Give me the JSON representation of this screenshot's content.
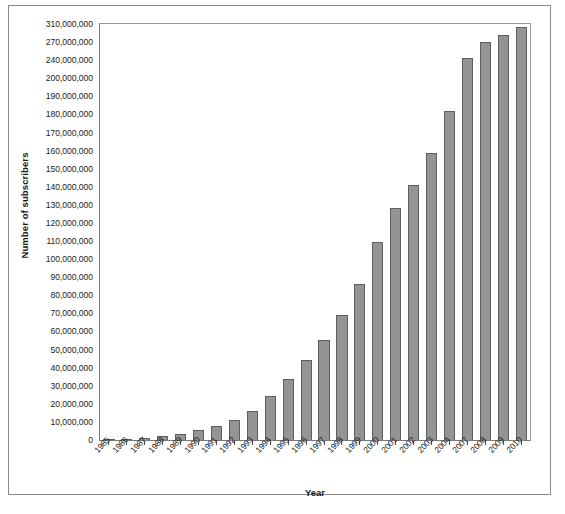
{
  "chart_data": {
    "type": "bar",
    "title": "",
    "xlabel": "Year",
    "ylabel": "Number of subscribers",
    "ylim": [
      0,
      310000000
    ],
    "grid": false,
    "legend": null,
    "bar_color": "#949494",
    "bar_edge_color": "#5f5f5f",
    "categories": [
      "1985",
      "1986",
      "1987",
      "1988",
      "1989",
      "1990",
      "1991",
      "1992",
      "1993",
      "1994",
      "1995",
      "1996",
      "1997",
      "1998",
      "1999",
      "2000",
      "2001",
      "2002",
      "2003",
      "2004",
      "2007",
      "2008",
      "2009",
      "2010"
    ],
    "values": [
      340213,
      681825,
      1230855,
      2069441,
      3508944,
      5283055,
      7557148,
      11032753,
      16009461,
      24134421,
      33785661,
      44042992,
      55312293,
      69209321,
      86047003,
      109478031,
      128374512,
      140766842,
      158721981,
      182140362,
      243428000,
      270333881,
      285646191,
      302859674
    ],
    "value_labels": [
      "340,213",
      "681,825",
      "1,230,855",
      "2,069,441",
      "3,508,944",
      "5,283,055",
      "7,557,148",
      "11,032,753",
      "16,009,461",
      "24,134,421",
      "33,785,661",
      "44,042,992",
      "55,312,293",
      "69,209,321",
      "86,047,003",
      "109,478,031",
      "128,374,512",
      "140,766,842",
      "158,721,981",
      "182,140,362",
      "243,428,000",
      "270,333,881",
      "285,646,191",
      "302,859,674"
    ],
    "ytick_values": [
      0,
      10000000,
      20000000,
      30000000,
      40000000,
      50000000,
      60000000,
      70000000,
      80000000,
      90000000,
      100000000,
      110000000,
      120000000,
      130000000,
      140000000,
      150000000,
      160000000,
      170000000,
      180000000,
      190000000,
      200000000,
      240000000,
      270000000,
      310000000
    ],
    "ytick_labels": [
      "0",
      "10,000,000",
      "20,000,000",
      "30,000,000",
      "40,000,000",
      "50,000,000",
      "60,000,000",
      "70,000,000",
      "80,000,000",
      "90,000,000",
      "100,000,000",
      "110,000,000",
      "120,000,000",
      "130,000,000",
      "140,000,000",
      "150,000,000",
      "160,000,000",
      "170,000,000",
      "180,000,000",
      "190,000,000",
      "200,000,000",
      "240,000,000",
      "270,000,000",
      "310,000,000"
    ]
  },
  "axes": {
    "y_title": "Number of subscribers",
    "x_title": "Year"
  }
}
